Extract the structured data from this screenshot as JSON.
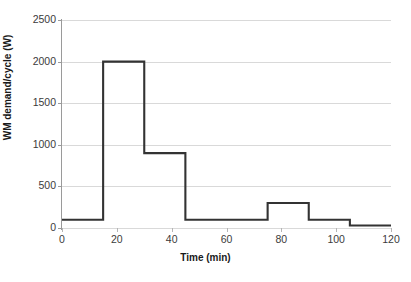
{
  "chart_data": {
    "type": "line",
    "subtype": "step-post",
    "title": "",
    "xlabel": "Time (min)",
    "ylabel": "WM demand/cycle (W)",
    "xlim": [
      0,
      120
    ],
    "ylim": [
      0,
      2500
    ],
    "xticks": [
      0,
      20,
      40,
      60,
      80,
      100,
      120
    ],
    "yticks": [
      0,
      500,
      1000,
      1500,
      2000,
      2500
    ],
    "grid": "horizontal",
    "legend": "none",
    "series": [
      {
        "name": "WM demand/cycle",
        "color": "#333333",
        "x": [
          0,
          15,
          30,
          45,
          75,
          90,
          105,
          120
        ],
        "values": [
          100,
          2000,
          900,
          100,
          300,
          100,
          30,
          30
        ],
        "steps": [
          {
            "x_start": 0,
            "x_end": 15,
            "y": 100
          },
          {
            "x_start": 15,
            "x_end": 30,
            "y": 2000
          },
          {
            "x_start": 30,
            "x_end": 45,
            "y": 900
          },
          {
            "x_start": 45,
            "x_end": 75,
            "y": 100
          },
          {
            "x_start": 75,
            "x_end": 90,
            "y": 300
          },
          {
            "x_start": 90,
            "x_end": 105,
            "y": 100
          },
          {
            "x_start": 105,
            "x_end": 120,
            "y": 30
          }
        ]
      }
    ],
    "colors": {
      "series": "#333333",
      "gridline": "#d9d9d9",
      "axis": "#9a9a9a",
      "text": "#3b3b3b",
      "background": "#ffffff"
    }
  }
}
